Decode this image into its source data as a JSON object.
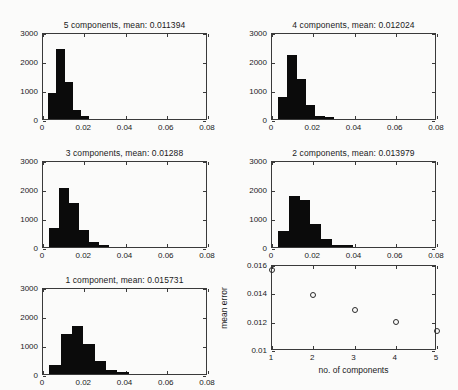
{
  "figure": {
    "background_color": "#fbfbfa",
    "axis_color": "#3a3a3a",
    "bar_color": "#0b0b0b"
  },
  "chart_data": [
    {
      "type": "bar",
      "panel_id": "hist-5-components",
      "title": "5 components, mean: 0.011394",
      "mean": 0.011394,
      "components": 5,
      "xlabel": "",
      "ylabel": "",
      "xlim": [
        0,
        0.08
      ],
      "ylim": [
        0,
        3000
      ],
      "xticks": [
        0,
        0.02,
        0.04,
        0.06,
        0.08
      ],
      "xticklabels": [
        "0",
        "0.02",
        "0.04",
        "0.06",
        "0.08"
      ],
      "yticks": [
        0,
        1000,
        2000,
        3000
      ],
      "yticklabels": [
        "0",
        "1000",
        "2000",
        "3000"
      ],
      "bin_edges": [
        0.0025,
        0.0065,
        0.0105,
        0.0145,
        0.0185,
        0.0225,
        0.0265
      ],
      "values": [
        880,
        2430,
        1270,
        320,
        90
      ],
      "grid": false
    },
    {
      "type": "bar",
      "panel_id": "hist-4-components",
      "title": "4 components, mean: 0.012024",
      "mean": 0.012024,
      "components": 4,
      "xlabel": "",
      "ylabel": "",
      "xlim": [
        0,
        0.08
      ],
      "ylim": [
        0,
        3000
      ],
      "xticks": [
        0,
        0.02,
        0.04,
        0.06,
        0.08
      ],
      "xticklabels": [
        "0",
        "0.02",
        "0.04",
        "0.06",
        "0.08"
      ],
      "yticks": [
        0,
        1000,
        2000,
        3000
      ],
      "yticklabels": [
        "0",
        "1000",
        "2000",
        "3000"
      ],
      "bin_edges": [
        0.003,
        0.0075,
        0.012,
        0.0165,
        0.021,
        0.0255,
        0.03
      ],
      "values": [
        760,
        2220,
        1390,
        470,
        110,
        30
      ],
      "grid": false
    },
    {
      "type": "bar",
      "panel_id": "hist-3-components",
      "title": "3 components, mean: 0.01288",
      "mean": 0.01288,
      "components": 3,
      "xlabel": "",
      "ylabel": "",
      "xlim": [
        0,
        0.08
      ],
      "ylim": [
        0,
        3000
      ],
      "xticks": [
        0,
        0.02,
        0.04,
        0.06,
        0.08
      ],
      "xticklabels": [
        "0",
        "0.02",
        "0.04",
        "0.06",
        "0.08"
      ],
      "yticks": [
        0,
        1000,
        2000,
        3000
      ],
      "yticklabels": [
        "0",
        "1000",
        "2000",
        "3000"
      ],
      "bin_edges": [
        0.003,
        0.0078,
        0.0126,
        0.0174,
        0.0222,
        0.027,
        0.0318
      ],
      "values": [
        640,
        2020,
        1510,
        590,
        180,
        50
      ],
      "grid": false
    },
    {
      "type": "bar",
      "panel_id": "hist-2-components",
      "title": "2 components, mean: 0.013979",
      "mean": 0.013979,
      "components": 2,
      "xlabel": "",
      "ylabel": "",
      "xlim": [
        0,
        0.08
      ],
      "ylim": [
        0,
        3000
      ],
      "xticks": [
        0,
        0.02,
        0.04,
        0.06,
        0.08
      ],
      "xticklabels": [
        "0",
        "0.02",
        "0.04",
        "0.06",
        "0.08"
      ],
      "yticks": [
        0,
        1000,
        2000,
        3000
      ],
      "yticklabels": [
        "0",
        "1000",
        "2000",
        "3000"
      ],
      "bin_edges": [
        0.003,
        0.0082,
        0.0134,
        0.0186,
        0.0238,
        0.029,
        0.0342,
        0.0394
      ],
      "values": [
        540,
        1750,
        1620,
        800,
        270,
        80,
        30
      ],
      "grid": false
    },
    {
      "type": "bar",
      "panel_id": "hist-1-component",
      "title": "1 component, mean: 0.015731",
      "mean": 0.015731,
      "components": 1,
      "xlabel": "",
      "ylabel": "",
      "xlim": [
        0,
        0.08
      ],
      "ylim": [
        0,
        3000
      ],
      "xticks": [
        0,
        0.02,
        0.04,
        0.06,
        0.08
      ],
      "xticklabels": [
        "0",
        "0.02",
        "0.04",
        "0.06",
        "0.08"
      ],
      "yticks": [
        0,
        1000,
        2000,
        3000
      ],
      "yticklabels": [
        "0",
        "1000",
        "2000",
        "3000"
      ],
      "bin_edges": [
        0.003,
        0.0085,
        0.014,
        0.0195,
        0.025,
        0.0305,
        0.036,
        0.0415
      ],
      "values": [
        300,
        1380,
        1660,
        1030,
        460,
        140,
        40
      ],
      "grid": false
    },
    {
      "type": "scatter",
      "panel_id": "mean-error-vs-components",
      "title": "",
      "xlabel": "no. of components",
      "ylabel": "mean error",
      "xlim": [
        1,
        5
      ],
      "ylim": [
        0.01,
        0.016
      ],
      "xticks": [
        1,
        2,
        3,
        4,
        5
      ],
      "xticklabels": [
        "1",
        "2",
        "3",
        "4",
        "5"
      ],
      "yticks": [
        0.01,
        0.012,
        0.014,
        0.016
      ],
      "yticklabels": [
        "0.01",
        "0.012",
        "0.014",
        "0.016"
      ],
      "x": [
        1,
        2,
        3,
        4,
        5
      ],
      "y": [
        0.015731,
        0.013979,
        0.01288,
        0.012024,
        0.011394
      ],
      "marker": "open-circle",
      "grid": false
    }
  ]
}
